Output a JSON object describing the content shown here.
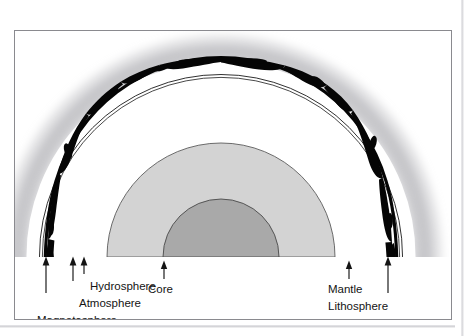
{
  "page": {
    "running_header": "",
    "background_color": "#ffffff"
  },
  "figure": {
    "frame_border_color": "#8a8a8f",
    "title": "",
    "caption": ""
  },
  "diagram": {
    "type": "earth-cross-section",
    "center_x": 236,
    "baseline_y": 225,
    "layers": [
      {
        "name": "magnetosphere",
        "label": "Magnetosphere",
        "color": "#b4b4b8",
        "style": "soft-gray-gradient-halo",
        "outer_radius": 222,
        "inner_radius": 196
      },
      {
        "name": "atmosphere",
        "label": "Atmosphere",
        "color": "#ffffff",
        "style": "white-gap-band",
        "outer_radius": 196,
        "inner_radius": 186
      },
      {
        "name": "hydrosphere",
        "label": "Hydrosphere",
        "color": "#000000",
        "style": "thin-double-line",
        "outer_radius": 186,
        "inner_radius": 180
      },
      {
        "name": "lithosphere",
        "label": "Lithosphere",
        "color": "#000000",
        "style": "thick-irregular-black-arc",
        "outer_radius": 182,
        "inner_radius": 176
      },
      {
        "name": "mantle",
        "label": "Mantle",
        "color": "#d2d2d2",
        "style": "light-gray-semicircle",
        "outer_radius": 114,
        "inner_radius": 58
      },
      {
        "name": "core",
        "label": "Core",
        "color": "#a8a8a8",
        "style": "dark-gray-semicircle",
        "outer_radius": 58,
        "inner_radius": 0
      }
    ],
    "callouts": [
      {
        "id": "magnetosphere",
        "label": "Magnetosphere",
        "side": "left",
        "arrow_x": 116,
        "arrow_top_y": 226,
        "arrow_bottom_y": 262,
        "label_x": 104,
        "label_y": 285,
        "anchor": "end"
      },
      {
        "id": "atmosphere",
        "label": "Atmosphere",
        "side": "left",
        "arrow_x": 144,
        "arrow_top_y": 226,
        "arrow_bottom_y": 250,
        "label_x": 131,
        "label_y": 272,
        "anchor": "end"
      },
      {
        "id": "hydrosphere",
        "label": "Hydrosphere",
        "side": "left",
        "arrow_x": 155,
        "arrow_top_y": 226,
        "arrow_bottom_y": 243,
        "label_x": 160,
        "label_y": 259,
        "anchor": "start"
      },
      {
        "id": "core",
        "label": "Core",
        "side": "center",
        "arrow_x": 176,
        "arrow_top_y": 230,
        "arrow_bottom_y": 248,
        "label_x": 160,
        "label_y": 262,
        "anchor": "start"
      },
      {
        "id": "mantle",
        "label": "Mantle",
        "side": "right",
        "arrow_x": 361,
        "arrow_top_y": 230,
        "arrow_bottom_y": 248,
        "label_x": 339,
        "label_y": 264,
        "anchor": "start"
      },
      {
        "id": "lithosphere",
        "label": "Lithosphere",
        "side": "right",
        "arrow_x": 400,
        "arrow_top_y": 226,
        "arrow_bottom_y": 262,
        "label_x": 340,
        "label_y": 279,
        "anchor": "start"
      }
    ],
    "labels": {
      "magnetosphere": "Magnetosphere",
      "atmosphere": "Atmosphere",
      "hydrosphere": "Hydrosphere",
      "core": "Core",
      "mantle": "Mantle",
      "lithosphere": "Lithosphere"
    }
  }
}
